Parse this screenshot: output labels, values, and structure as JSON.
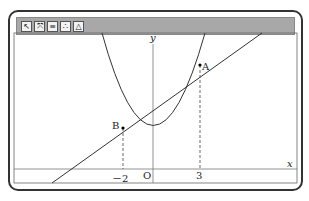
{
  "toolbar": {
    "tools": [
      {
        "icon": "select-icon",
        "glyph": "↖"
      },
      {
        "icon": "zoom-fit-icon",
        "glyph": "⤧"
      },
      {
        "icon": "equal-scale-icon",
        "glyph": "≡"
      },
      {
        "icon": "points-icon",
        "glyph": "∴"
      },
      {
        "icon": "triangle-icon",
        "glyph": "△"
      }
    ]
  },
  "graph": {
    "x_axis_label": "x",
    "y_axis_label": "y",
    "origin_label": "O",
    "tick_neg2": "－2",
    "tick_3": "3",
    "point_a": "A",
    "point_b": "B"
  },
  "colors": {
    "titlebar": "#a8a8a8",
    "curve": "#333333"
  }
}
